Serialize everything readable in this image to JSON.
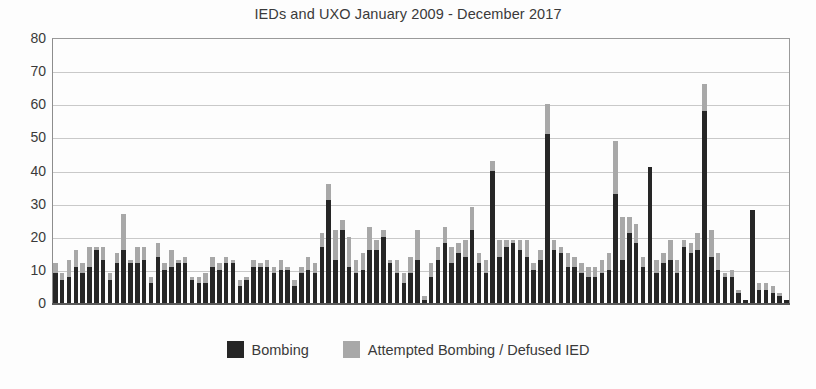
{
  "chart_data": {
    "type": "bar",
    "subtype": "stacked-column",
    "title": "IEDs and UXO January 2009 - December 2017",
    "xlabel": "",
    "ylabel": "",
    "ylim": [
      0,
      80
    ],
    "ytick_step": 10,
    "yticks": [
      80,
      70,
      60,
      50,
      40,
      30,
      20,
      10,
      0
    ],
    "grid": true,
    "grid_axis": "y",
    "legend_position": "bottom",
    "colors": {
      "bombing": "#262626",
      "attempted": "#a8a8a8"
    },
    "series": [
      {
        "name": "Bombing",
        "color": "#262626",
        "values": [
          9,
          7,
          8,
          11,
          9,
          11,
          16,
          13,
          7,
          12,
          16,
          12,
          12,
          13,
          6,
          14,
          10,
          11,
          12,
          12,
          7,
          6,
          6,
          11,
          10,
          12,
          12,
          5,
          7,
          11,
          11,
          11,
          9,
          10,
          10,
          5,
          9,
          10,
          9,
          17,
          31,
          13,
          22,
          11,
          9,
          10,
          16,
          16,
          20,
          12,
          9,
          6,
          9,
          13,
          1,
          8,
          13,
          18,
          12,
          15,
          14,
          22,
          12,
          9,
          40,
          14,
          17,
          18,
          16,
          14,
          10,
          13,
          51,
          16,
          15,
          11,
          11,
          9,
          8,
          8,
          9,
          10,
          33,
          13,
          21,
          18,
          11,
          41,
          9,
          12,
          13,
          9,
          17,
          15,
          16,
          58,
          14,
          10,
          8,
          8,
          3,
          1,
          28,
          4,
          4,
          3,
          2,
          1
        ],
        "total": 1452
      },
      {
        "name": "Attempted Bombing / Defused IED",
        "color": "#a8a8a8",
        "values": [
          3,
          2,
          5,
          5,
          3,
          6,
          1,
          4,
          2,
          3,
          11,
          1,
          5,
          4,
          2,
          4,
          2,
          5,
          1,
          2,
          1,
          2,
          3,
          3,
          2,
          2,
          1,
          2,
          1,
          2,
          1,
          2,
          2,
          3,
          1,
          2,
          2,
          4,
          3,
          4,
          5,
          9,
          3,
          9,
          4,
          5,
          7,
          3,
          2,
          1,
          4,
          3,
          5,
          9,
          1,
          4,
          4,
          5,
          5,
          3,
          5,
          7,
          3,
          4,
          3,
          5,
          2,
          1,
          3,
          5,
          2,
          3,
          9,
          3,
          2,
          4,
          3,
          3,
          3,
          3,
          4,
          5,
          16,
          13,
          5,
          6,
          3,
          0,
          4,
          3,
          6,
          4,
          2,
          3,
          5,
          8,
          8,
          5,
          1,
          2,
          1,
          0,
          0,
          2,
          2,
          2,
          1,
          0
        ],
        "total": 426
      }
    ],
    "categories": [
      "Jan 2009",
      "Feb 2009",
      "Mar 2009",
      "Apr 2009",
      "May 2009",
      "Jun 2009",
      "Jul 2009",
      "Aug 2009",
      "Sep 2009",
      "Oct 2009",
      "Nov 2009",
      "Dec 2009",
      "Jan 2010",
      "Feb 2010",
      "Mar 2010",
      "Apr 2010",
      "May 2010",
      "Jun 2010",
      "Jul 2010",
      "Aug 2010",
      "Sep 2010",
      "Oct 2010",
      "Nov 2010",
      "Dec 2010",
      "Jan 2011",
      "Feb 2011",
      "Mar 2011",
      "Apr 2011",
      "May 2011",
      "Jun 2011",
      "Jul 2011",
      "Aug 2011",
      "Sep 2011",
      "Oct 2011",
      "Nov 2011",
      "Dec 2011",
      "Jan 2012",
      "Feb 2012",
      "Mar 2012",
      "Apr 2012",
      "May 2012",
      "Jun 2012",
      "Jul 2012",
      "Aug 2012",
      "Sep 2012",
      "Oct 2012",
      "Nov 2012",
      "Dec 2012",
      "Jan 2013",
      "Feb 2013",
      "Mar 2013",
      "Apr 2013",
      "May 2013",
      "Jun 2013",
      "Jul 2013",
      "Aug 2013",
      "Sep 2013",
      "Oct 2013",
      "Nov 2013",
      "Dec 2013",
      "Jan 2014",
      "Feb 2014",
      "Mar 2014",
      "Apr 2014",
      "May 2014",
      "Jun 2014",
      "Jul 2014",
      "Aug 2014",
      "Sep 2014",
      "Oct 2014",
      "Nov 2014",
      "Dec 2014",
      "Jan 2015",
      "Feb 2015",
      "Mar 2015",
      "Apr 2015",
      "May 2015",
      "Jun 2015",
      "Jul 2015",
      "Aug 2015",
      "Sep 2015",
      "Oct 2015",
      "Nov 2015",
      "Dec 2015",
      "Jan 2016",
      "Feb 2016",
      "Mar 2016",
      "Apr 2016",
      "May 2016",
      "Jun 2016",
      "Jul 2016",
      "Aug 2016",
      "Sep 2016",
      "Oct 2016",
      "Nov 2016",
      "Dec 2016",
      "Jan 2017",
      "Feb 2017",
      "Mar 2017",
      "Apr 2017",
      "May 2017",
      "Jun 2017",
      "Jul 2017",
      "Aug 2017",
      "Sep 2017",
      "Oct 2017",
      "Nov 2017",
      "Dec 2017"
    ],
    "annotations": []
  },
  "legend": {
    "items": [
      {
        "label": "Bombing",
        "swatch": "dark"
      },
      {
        "label": "Attempted Bombing / Defused IED",
        "swatch": "light"
      }
    ]
  }
}
